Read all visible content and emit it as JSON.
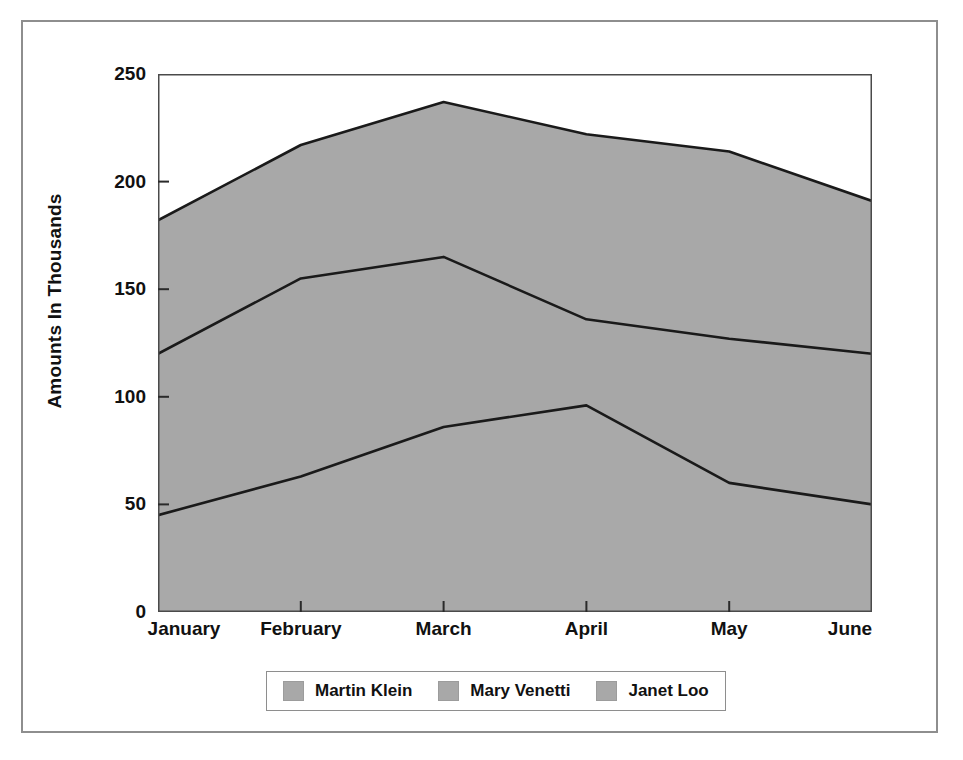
{
  "chart_data": {
    "type": "area",
    "stacked": true,
    "title": "",
    "subtitle": "",
    "xlabel": "",
    "ylabel": "Amounts In Thousands",
    "categories": [
      "January",
      "February",
      "March",
      "April",
      "May",
      "June"
    ],
    "series": [
      {
        "name": "Janet Loo",
        "values": [
          45,
          63,
          86,
          96,
          60,
          50
        ]
      },
      {
        "name": "Mary Venetti",
        "values": [
          75,
          92,
          79,
          40,
          67,
          70
        ]
      },
      {
        "name": "Martin Klein",
        "values": [
          62,
          62,
          72,
          86,
          87,
          71
        ]
      }
    ],
    "cumulative_tops": {
      "Janet Loo": [
        45,
        63,
        86,
        96,
        60,
        50
      ],
      "Mary Venetti": [
        120,
        155,
        165,
        136,
        127,
        120
      ],
      "Martin Klein": [
        182,
        217,
        237,
        222,
        214,
        191
      ]
    },
    "ylim": [
      0,
      250
    ],
    "yticks": [
      0,
      50,
      100,
      150,
      200,
      250
    ],
    "ytick_labels": [
      "0",
      "50",
      "100",
      "150",
      "200",
      "250"
    ],
    "grid": false,
    "legend_position": "bottom",
    "colors": {
      "janet_loo": "#a9a9a9",
      "mary_venetti": "#a7a7a7",
      "martin_klein": "#a8a8a8",
      "line": "#1a1a1a",
      "frame": "#8e8e8e",
      "text": "#111111",
      "background": "#ffffff"
    }
  },
  "axes": {
    "y_title": "Amounts In Thousands",
    "y_ticks": [
      {
        "label": "250",
        "value": 250
      },
      {
        "label": "200",
        "value": 200
      },
      {
        "label": "150",
        "value": 150
      },
      {
        "label": "100",
        "value": 100
      },
      {
        "label": "50",
        "value": 50
      },
      {
        "label": "0",
        "value": 0
      }
    ],
    "x_ticks": [
      {
        "label": "January"
      },
      {
        "label": "February"
      },
      {
        "label": "March"
      },
      {
        "label": "April"
      },
      {
        "label": "May"
      },
      {
        "label": "June"
      }
    ]
  },
  "legend": {
    "entries": [
      {
        "label": "Martin Klein",
        "swatch_color": "#a8a8a8"
      },
      {
        "label": "Mary Venetti",
        "swatch_color": "#a8a8a8"
      },
      {
        "label": "Janet Loo",
        "swatch_color": "#a8a8a8"
      }
    ]
  }
}
